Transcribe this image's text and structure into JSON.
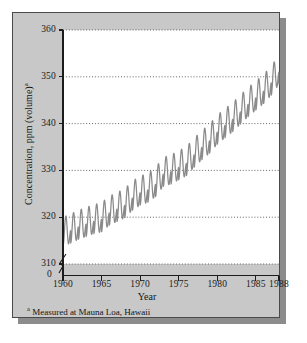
{
  "figure": {
    "footnote_marker": "a",
    "footnote_text": " Measured at Mauna Loa, Hawaii",
    "zero_label": "0"
  },
  "chart_data": {
    "type": "line",
    "title": "",
    "subtitle": "",
    "xlabel": "Year",
    "ylabel": "Concentration, ppm (volume)",
    "ylabel_superscript": "a",
    "annotations": [
      "a Measured at Mauna Loa, Hawaii"
    ],
    "grid": true,
    "grid_orientation": "horizontal",
    "legend": "none",
    "axis_break_y": true,
    "axis_break_between": [
      0,
      310
    ],
    "xlim": [
      1960,
      1988
    ],
    "ylim": [
      310,
      360
    ],
    "xticks": [
      1960,
      1965,
      1970,
      1975,
      1980,
      1985,
      1988
    ],
    "xtick_labels": [
      "1960",
      "1965",
      "1970",
      "1975",
      "1980",
      "1985",
      "1988"
    ],
    "yticks": [
      310,
      320,
      330,
      340,
      350,
      360
    ],
    "ytick_labels": [
      "310",
      "320",
      "330",
      "340",
      "350",
      "360"
    ],
    "series_name": "Atmospheric CO2 concentration",
    "line_color": "#8a8a8a",
    "series": [
      {
        "name": "Atmospheric CO2 concentration",
        "description": "Annual mean trend with seasonal sawtooth oscillation of about +/- 3 ppm",
        "annual_mean_x": [
          1960,
          1961,
          1962,
          1963,
          1964,
          1965,
          1966,
          1967,
          1968,
          1969,
          1970,
          1971,
          1972,
          1973,
          1974,
          1975,
          1976,
          1977,
          1978,
          1979,
          1980,
          1981,
          1982,
          1983,
          1984,
          1985,
          1986,
          1987,
          1988
        ],
        "annual_mean_y": [
          316.9,
          317.6,
          318.4,
          319.0,
          319.6,
          320.0,
          321.4,
          322.2,
          323.0,
          324.6,
          325.7,
          326.3,
          327.5,
          329.7,
          330.2,
          331.1,
          332.0,
          333.8,
          335.4,
          336.8,
          338.7,
          340.1,
          341.4,
          343.0,
          344.6,
          346.0,
          347.4,
          349.2,
          351.5
        ],
        "seasonal_amplitude_ppm": 3.1,
        "seasonal_peak_month": "May",
        "seasonal_trough_month": "September",
        "start_value_ppm": 315.0,
        "end_value_ppm": 352.5
      }
    ]
  }
}
